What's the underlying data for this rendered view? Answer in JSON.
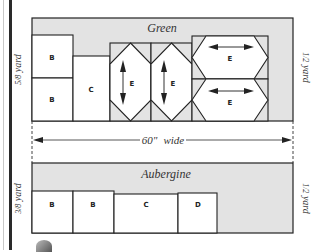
{
  "diagram": {
    "type": "fabric-cutting-layout",
    "colors": {
      "fabric_fill": "#e3e3e3",
      "piece_fill": "#ffffff",
      "outline": "#222222",
      "dimension_line": "#444444"
    },
    "green_panel": {
      "title": "Green",
      "left_measure": "5/8 yard",
      "left_measure_fraction": "5/8",
      "left_measure_unit": "yard",
      "right_measure": "1/2 yard",
      "right_measure_fraction": "1/2",
      "right_measure_unit": "yard",
      "pieces": [
        {
          "id": "B1",
          "label": "B"
        },
        {
          "id": "B2",
          "label": "B"
        },
        {
          "id": "C",
          "label": "C"
        },
        {
          "id": "E1",
          "label": "E",
          "grain": "vertical"
        },
        {
          "id": "E2",
          "label": "E",
          "grain": "vertical"
        },
        {
          "id": "E3",
          "label": "E",
          "grain": "horizontal"
        },
        {
          "id": "E4",
          "label": "E",
          "grain": "horizontal"
        }
      ]
    },
    "width_dimension": {
      "label_number": "60\"",
      "label_text": "wide"
    },
    "aubergine_panel": {
      "title": "Aubergine",
      "left_measure": "3/8 yard",
      "left_measure_fraction": "3/8",
      "left_measure_unit": "yard",
      "right_measure": "1/2 yard",
      "right_measure_fraction": "1/2",
      "right_measure_unit": "yard",
      "pieces": [
        {
          "id": "B1",
          "label": "B"
        },
        {
          "id": "B2",
          "label": "B"
        },
        {
          "id": "C",
          "label": "C"
        },
        {
          "id": "D",
          "label": "D"
        }
      ]
    }
  }
}
